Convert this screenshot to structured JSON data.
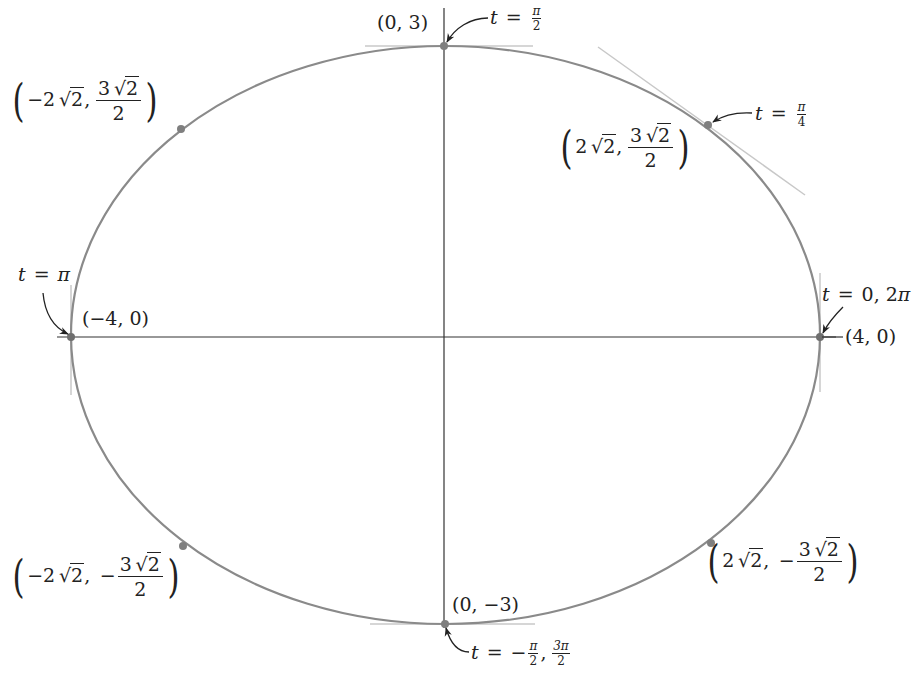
{
  "figure": {
    "colors": {
      "background": "#ffffff",
      "curve": "#8a8a8a",
      "axes": "#333333",
      "tangent": "#c8c8c8",
      "point": "#7f7f7f",
      "arrow": "#222222",
      "text": "#222222"
    },
    "ellipse": {
      "a": 4,
      "b": 3
    },
    "points": [
      {
        "id": "p_right",
        "coords": "(4, 0)",
        "t": "t = 0, 2π"
      },
      {
        "id": "p_top",
        "coords": "(0, 3)",
        "t": "t = π/2"
      },
      {
        "id": "p_left",
        "coords": "(−4, 0)",
        "t": "t = π"
      },
      {
        "id": "p_bottom",
        "coords": "(0, −3)",
        "t": "t = −π/2, 3π/2"
      },
      {
        "id": "p_q1",
        "coords": "(2√2, 3√2/2)",
        "t": "t = π/4"
      },
      {
        "id": "p_q2",
        "coords": "(−2√2, 3√2/2)"
      },
      {
        "id": "p_q3",
        "coords": "(−2√2, −3√2/2)"
      },
      {
        "id": "p_q4",
        "coords": "(2√2, −3√2/2)"
      }
    ]
  },
  "labels": {
    "top_point": "(0, 3)",
    "top_t_var": "t",
    "top_t_eq": "=",
    "top_t_num": "π",
    "top_t_den": "2",
    "q1_t_var": "t",
    "q1_t_eq": "=",
    "q1_t_num": "π",
    "q1_t_den": "4",
    "q1_x_coef": "2",
    "q1_x_rad": "2",
    "q1_y_num_coef": "3",
    "q1_y_num_rad": "2",
    "q1_y_den": "2",
    "q2_x_coef": "−2",
    "q2_x_rad": "2",
    "q2_y_num_coef": "3",
    "q2_y_num_rad": "2",
    "q2_y_den": "2",
    "left_t_var": "t",
    "left_t_eq": "=",
    "left_t_val": "π",
    "left_point": "(−4, 0)",
    "right_t_var": "t",
    "right_t_eq": "=",
    "right_t_val": "0, 2",
    "right_t_pi": "π",
    "right_point": "(4, 0)",
    "q3_x_coef": "−2",
    "q3_x_rad": "2",
    "q3_sign": "−",
    "q3_y_num_coef": "3",
    "q3_y_num_rad": "2",
    "q3_y_den": "2",
    "q4_x_coef": "2",
    "q4_x_rad": "2",
    "q4_sign": "−",
    "q4_y_num_coef": "3",
    "q4_y_num_rad": "2",
    "q4_y_den": "2",
    "bottom_point": "(0, −3)",
    "bottom_t_var": "t",
    "bottom_t_eq": "=",
    "bottom_t_sign": "−",
    "bottom_t1_num": "π",
    "bottom_t1_den": "2",
    "bottom_t2_num": "3π",
    "bottom_t2_den": "2",
    "paren_open": "(",
    "paren_close": ")",
    "comma": ",",
    "sqrt": "√"
  }
}
